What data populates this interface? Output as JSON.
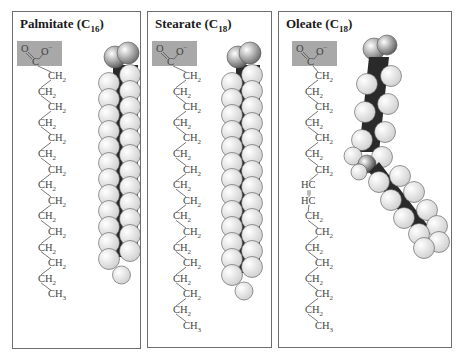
{
  "panels": [
    {
      "name": "palmitate",
      "title": "Palmitate (C",
      "subscript": "16",
      "title_close": ")",
      "carboxyl": {
        "o_left": "O",
        "o_right": "O",
        "charge": "−",
        "carbon": "C"
      },
      "chain": [
        "CH2",
        "CH2",
        "CH2",
        "CH2",
        "CH2",
        "CH2",
        "CH2",
        "CH2",
        "CH2",
        "CH2",
        "CH2",
        "CH2",
        "CH2",
        "CH2",
        "CH3"
      ],
      "model": "space-filling, straight chain"
    },
    {
      "name": "stearate",
      "title": "Stearate (C",
      "subscript": "18",
      "title_close": ")",
      "carboxyl": {
        "o_left": "O",
        "o_right": "O",
        "charge": "−",
        "carbon": "C"
      },
      "chain": [
        "CH2",
        "CH2",
        "CH2",
        "CH2",
        "CH2",
        "CH2",
        "CH2",
        "CH2",
        "CH2",
        "CH2",
        "CH2",
        "CH2",
        "CH2",
        "CH2",
        "CH2",
        "CH2",
        "CH3"
      ],
      "model": "space-filling, straight chain"
    },
    {
      "name": "oleate",
      "title": "Oleate (C",
      "subscript": "18",
      "title_close": ")",
      "carboxyl": {
        "o_left": "O",
        "o_right": "O",
        "charge": "−",
        "carbon": "C"
      },
      "chain": [
        "CH2",
        "CH2",
        "CH2",
        "CH2",
        "CH2",
        "CH2",
        "CH2",
        "HC",
        "HC",
        "CH2",
        "CH2",
        "CH2",
        "CH2",
        "CH2",
        "CH2",
        "CH2",
        "CH3"
      ],
      "double_bond_symbol": "=",
      "model": "space-filling, kinked chain at cis double bond"
    }
  ],
  "colors": {
    "carboxyl_box": "#a8a8a8",
    "oxygen": "#6a6a6a",
    "carbon": "#2a2a2a",
    "hydrogen": "#f4f4f4",
    "border": "#6e6e6e",
    "text": "#444444"
  }
}
